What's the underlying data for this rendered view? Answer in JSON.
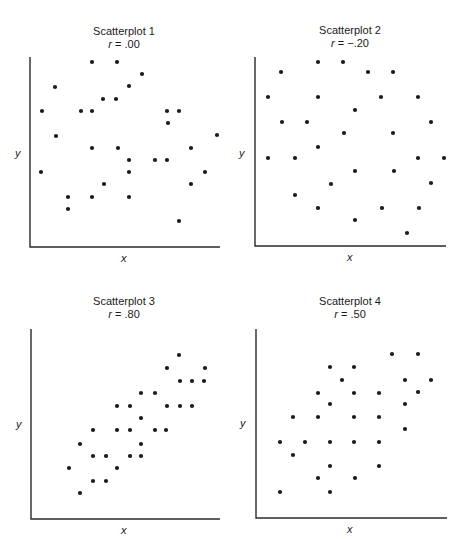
{
  "chart_data": [
    {
      "type": "scatter",
      "title": "Scatterplot 1",
      "subtitle": "r = .00",
      "r_symbol": "r",
      "r_value": " = .00",
      "xlabel": "x",
      "ylabel": "y",
      "grid": false,
      "axis_origin_px": [
        30,
        247
      ],
      "axis_end_px": [
        220,
        57
      ],
      "points_px": [
        [
          92,
          62
        ],
        [
          117,
          62
        ],
        [
          142,
          74
        ],
        [
          55,
          87
        ],
        [
          129,
          86
        ],
        [
          103,
          99
        ],
        [
          116,
          99
        ],
        [
          42,
          111
        ],
        [
          81,
          111
        ],
        [
          92,
          111
        ],
        [
          167,
          111
        ],
        [
          179,
          111
        ],
        [
          168,
          123
        ],
        [
          56,
          136
        ],
        [
          217,
          135
        ],
        [
          92,
          148
        ],
        [
          118,
          148
        ],
        [
          191,
          148
        ],
        [
          129,
          160
        ],
        [
          155,
          160
        ],
        [
          167,
          160
        ],
        [
          41,
          172
        ],
        [
          129,
          172
        ],
        [
          205,
          172
        ],
        [
          104,
          184
        ],
        [
          191,
          184
        ],
        [
          68,
          197
        ],
        [
          92,
          197
        ],
        [
          129,
          197
        ],
        [
          68,
          209
        ],
        [
          179,
          221
        ]
      ]
    },
    {
      "type": "scatter",
      "title": "Scatterplot 2",
      "subtitle": "r = −.20",
      "r_symbol": "r",
      "r_value": " = −.20",
      "xlabel": "x",
      "ylabel": "y",
      "grid": false,
      "axis_origin_px": [
        255,
        246
      ],
      "axis_end_px": [
        446,
        57
      ],
      "points_px": [
        [
          318,
          62
        ],
        [
          343,
          62
        ],
        [
          281,
          72
        ],
        [
          368,
          72
        ],
        [
          393,
          72
        ],
        [
          268,
          97
        ],
        [
          318,
          97
        ],
        [
          381,
          97
        ],
        [
          418,
          97
        ],
        [
          355,
          110
        ],
        [
          282,
          122
        ],
        [
          307,
          122
        ],
        [
          431,
          122
        ],
        [
          344,
          133
        ],
        [
          393,
          133
        ],
        [
          318,
          147
        ],
        [
          268,
          158
        ],
        [
          295,
          158
        ],
        [
          418,
          158
        ],
        [
          444,
          158
        ],
        [
          355,
          171
        ],
        [
          394,
          171
        ],
        [
          331,
          184
        ],
        [
          431,
          183
        ],
        [
          295,
          195
        ],
        [
          318,
          208
        ],
        [
          382,
          208
        ],
        [
          419,
          208
        ],
        [
          355,
          220
        ],
        [
          407,
          233
        ]
      ]
    },
    {
      "type": "scatter",
      "title": "Scatterplot 3",
      "subtitle": "r = .80",
      "r_symbol": "r",
      "r_value": " = .80",
      "xlabel": "x",
      "ylabel": "y",
      "grid": false,
      "axis_origin_px": [
        31,
        519
      ],
      "axis_end_px": [
        220,
        329
      ],
      "points_px": [
        [
          179,
          355
        ],
        [
          167,
          368
        ],
        [
          205,
          368
        ],
        [
          180,
          381
        ],
        [
          192,
          381
        ],
        [
          204,
          381
        ],
        [
          141,
          393
        ],
        [
          155,
          393
        ],
        [
          117,
          406
        ],
        [
          130,
          406
        ],
        [
          167,
          406
        ],
        [
          180,
          406
        ],
        [
          192,
          406
        ],
        [
          141,
          418
        ],
        [
          93,
          430
        ],
        [
          117,
          430
        ],
        [
          130,
          430
        ],
        [
          155,
          430
        ],
        [
          166,
          430
        ],
        [
          80,
          444
        ],
        [
          141,
          444
        ],
        [
          93,
          456
        ],
        [
          106,
          456
        ],
        [
          130,
          456
        ],
        [
          141,
          456
        ],
        [
          69,
          468
        ],
        [
          117,
          468
        ],
        [
          93,
          481
        ],
        [
          106,
          481
        ],
        [
          80,
          493
        ]
      ]
    },
    {
      "type": "scatter",
      "title": "Scatterplot 4",
      "subtitle": "r = .50",
      "r_symbol": "r",
      "r_value": " = .50",
      "xlabel": "x",
      "ylabel": "y",
      "grid": false,
      "axis_origin_px": [
        256,
        518
      ],
      "axis_end_px": [
        447,
        329
      ],
      "points_px": [
        [
          392,
          354
        ],
        [
          418,
          354
        ],
        [
          330,
          367
        ],
        [
          354,
          367
        ],
        [
          342,
          380
        ],
        [
          405,
          380
        ],
        [
          431,
          380
        ],
        [
          318,
          393
        ],
        [
          354,
          393
        ],
        [
          379,
          393
        ],
        [
          418,
          392
        ],
        [
          330,
          404
        ],
        [
          405,
          404
        ],
        [
          293,
          417
        ],
        [
          318,
          417
        ],
        [
          354,
          417
        ],
        [
          379,
          417
        ],
        [
          405,
          429
        ],
        [
          280,
          442
        ],
        [
          305,
          442
        ],
        [
          330,
          442
        ],
        [
          354,
          442
        ],
        [
          379,
          442
        ],
        [
          293,
          455
        ],
        [
          330,
          466
        ],
        [
          379,
          466
        ],
        [
          318,
          478
        ],
        [
          355,
          478
        ],
        [
          280,
          492
        ],
        [
          330,
          492
        ]
      ]
    }
  ],
  "colors": {
    "ink": "#1a1a1a",
    "axis": "#2a2a2a",
    "background": "#ffffff"
  }
}
